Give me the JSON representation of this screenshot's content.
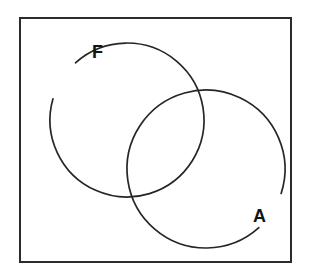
{
  "figure": {
    "kind": "venn-diagram",
    "canvas": {
      "width": 310,
      "height": 278,
      "background": "#ffffff"
    },
    "frame": {
      "name": "universal-set-frame",
      "x": 20,
      "y": 18,
      "width": 271,
      "height": 244,
      "stroke": "#2b2b2b",
      "stroke_width": 2
    },
    "stroke_color": "#262626",
    "stroke_width": 1.7,
    "label_color": "#141414",
    "sets": [
      {
        "id": "F",
        "label": "F",
        "center_x": 127,
        "center_y": 120,
        "radius": 77,
        "label_x": 92,
        "label_y": 58,
        "gap_start_deg": 196,
        "gap_end_deg": 228
      },
      {
        "id": "A",
        "label": "A",
        "center_x": 206,
        "center_y": 169,
        "radius": 79,
        "label_x": 253,
        "label_y": 222,
        "gap_start_deg": 18,
        "gap_end_deg": 48
      }
    ]
  }
}
